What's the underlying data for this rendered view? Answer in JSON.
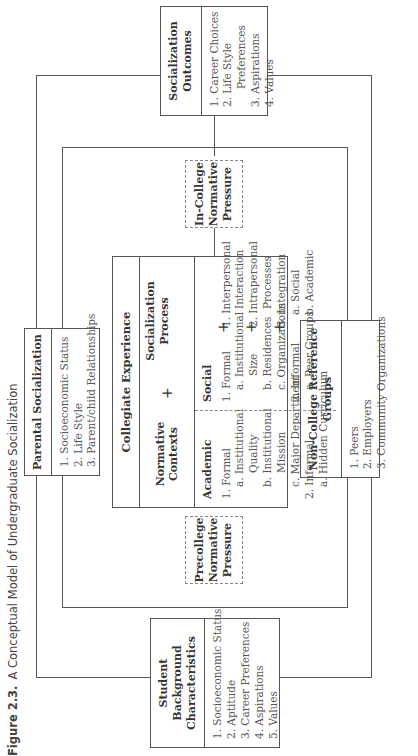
{
  "caption": {
    "label": "Figure 2.3.",
    "title": "A Conceptual Model of Undergraduate Socialization"
  },
  "boxes": {
    "student_background": {
      "title_line1": "Student Background",
      "title_line2": "Characteristics",
      "items": [
        "1. Socioeconomic Status",
        "2. Aptitude",
        "3. Career Preferences",
        "4. Aspirations",
        "5. Values"
      ]
    },
    "parental_socialization": {
      "title": "Parental Socialization",
      "items": [
        "1. Socioeconomic Status",
        "2. Life Style",
        "3. Parent/child Relationships"
      ]
    },
    "precollege_pressure": {
      "line1": "Precollege",
      "line2": "Normative",
      "line3": "Pressure"
    },
    "incollege_pressure": {
      "line1": "In-College",
      "line2": "Normative",
      "line3": "Pressure"
    },
    "non_college_groups": {
      "title": "Non-College Reference Groups",
      "items": [
        "1. Peers",
        "2. Employers",
        "3. Community Organizations"
      ]
    },
    "socialization_outcomes": {
      "title_line1": "Socialization",
      "title_line2": "Outcomes",
      "items": [
        "1. Career Choices",
        "2. Life Style",
        "Preferences",
        "3. Aspirations",
        "4. Values"
      ]
    },
    "collegiate_experience": {
      "title": "Collegiate Experience",
      "normative_contexts": "Normative Contexts",
      "plus": "+",
      "socialization_process_line1": "Socialization",
      "socialization_process_line2": "Process",
      "academic": {
        "header": "Academic",
        "items": [
          "1. Formal",
          "a. Institutional",
          "Quality",
          "b. Institutional",
          "Mission",
          "c. Major Department",
          "2. Informal",
          "a. Hidden Curriculum"
        ]
      },
      "social": {
        "header": "Social",
        "items": [
          "1. Formal",
          "a. Institutional",
          "Size",
          "b. Residences",
          "c. Organizations",
          "2. Informal",
          "a. Peer Groups"
        ]
      },
      "process": {
        "items": [
          "1. Interpersonal",
          "Interaction",
          "2. Intrapersonal",
          "Processes",
          "3. Integration",
          "a. Social",
          "b. Academic"
        ]
      }
    }
  },
  "colors": {
    "line": "#555555",
    "dashed": "#888888",
    "text": "#333333"
  }
}
